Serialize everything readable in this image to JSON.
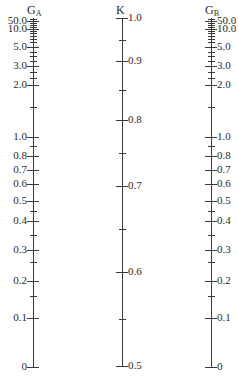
{
  "nomograph": {
    "axes": [
      {
        "id": "GA",
        "title": "G",
        "subscript": "A",
        "x": 33,
        "top": 18,
        "bottom": 367,
        "label_side": "left",
        "labeled_ticks": [
          {
            "label": "50.0",
            "y": 21
          },
          {
            "label": "10.0",
            "y": 29
          },
          {
            "label": "5.0",
            "y": 47
          },
          {
            "label": "3.0",
            "y": 66
          },
          {
            "label": "2.0",
            "y": 85
          },
          {
            "label": "1.0",
            "y": 137
          },
          {
            "label": "0.8",
            "y": 156
          },
          {
            "label": "0.7",
            "y": 170
          },
          {
            "label": "0.6",
            "y": 184
          },
          {
            "label": "0.5",
            "y": 201
          },
          {
            "label": "0.4",
            "y": 221
          },
          {
            "label": "0.3",
            "y": 250
          },
          {
            "label": "0.2",
            "y": 281
          },
          {
            "label": "0.1",
            "y": 318
          },
          {
            "label": "0",
            "y": 367
          }
        ],
        "minor_ticks": [
          19,
          23,
          25,
          27,
          31,
          33,
          36,
          39,
          42,
          52,
          56,
          61,
          72,
          78,
          107,
          146,
          211,
          235,
          262,
          296
        ]
      },
      {
        "id": "K",
        "title": "K",
        "subscript": "",
        "x": 122,
        "top": 18,
        "bottom": 367,
        "label_side": "right",
        "labeled_ticks": [
          {
            "label": "1.0",
            "y": 18
          },
          {
            "label": "0.9",
            "y": 61
          },
          {
            "label": "0.8",
            "y": 120
          },
          {
            "label": "0.7",
            "y": 186
          },
          {
            "label": "0.6",
            "y": 272
          },
          {
            "label": "0.5",
            "y": 366
          }
        ],
        "minor_ticks": [
          40,
          90,
          153,
          229,
          319
        ]
      },
      {
        "id": "GB",
        "title": "G",
        "subscript": "B",
        "x": 211,
        "top": 18,
        "bottom": 367,
        "label_side": "right",
        "labeled_ticks": [
          {
            "label": "50.0",
            "y": 21
          },
          {
            "label": "10.0",
            "y": 29
          },
          {
            "label": "5.0",
            "y": 47
          },
          {
            "label": "3.0",
            "y": 66
          },
          {
            "label": "2.0",
            "y": 85
          },
          {
            "label": "1.0",
            "y": 137
          },
          {
            "label": "0.8",
            "y": 156
          },
          {
            "label": "0.7",
            "y": 170
          },
          {
            "label": "0.6",
            "y": 184
          },
          {
            "label": "0.5",
            "y": 201
          },
          {
            "label": "0.4",
            "y": 221
          },
          {
            "label": "0.3",
            "y": 250
          },
          {
            "label": "0.2",
            "y": 281
          },
          {
            "label": "0.1",
            "y": 318
          },
          {
            "label": "0",
            "y": 367
          }
        ],
        "minor_ticks": [
          19,
          23,
          25,
          27,
          31,
          33,
          36,
          39,
          42,
          52,
          56,
          61,
          72,
          78,
          107,
          146,
          211,
          235,
          262,
          296
        ]
      }
    ]
  }
}
